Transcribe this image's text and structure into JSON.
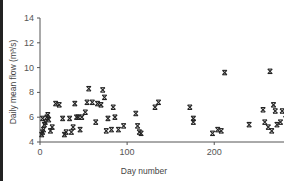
{
  "chart_data": {
    "type": "scatter",
    "title": "",
    "xlabel": "Day number",
    "ylabel": "Daily mean flow (m³/s)",
    "xlim": [
      0,
      365
    ],
    "ylim": [
      4,
      14
    ],
    "xticks": [
      0,
      100,
      200,
      300
    ],
    "yticks": [
      4,
      6,
      8,
      10,
      12,
      14
    ],
    "grid": false,
    "legend": null,
    "marker": "x",
    "series": [
      {
        "name": "Daily mean flow",
        "points": [
          [
            2,
            4.6
          ],
          [
            3,
            4.8
          ],
          [
            4,
            5.0
          ],
          [
            5,
            5.4
          ],
          [
            3,
            5.9
          ],
          [
            6,
            5.6
          ],
          [
            8,
            6.0
          ],
          [
            9,
            6.2
          ],
          [
            10,
            5.8
          ],
          [
            12,
            4.9
          ],
          [
            14,
            5.2
          ],
          [
            18,
            7.1
          ],
          [
            22,
            7.0
          ],
          [
            26,
            5.9
          ],
          [
            28,
            4.6
          ],
          [
            30,
            4.8
          ],
          [
            34,
            5.9
          ],
          [
            36,
            4.8
          ],
          [
            38,
            5.2
          ],
          [
            40,
            7.1
          ],
          [
            42,
            6.0
          ],
          [
            44,
            6.0
          ],
          [
            46,
            5.0
          ],
          [
            48,
            6.0
          ],
          [
            52,
            6.4
          ],
          [
            54,
            7.2
          ],
          [
            56,
            8.3
          ],
          [
            60,
            7.2
          ],
          [
            64,
            5.6
          ],
          [
            66,
            7.1
          ],
          [
            70,
            7.0
          ],
          [
            72,
            8.2
          ],
          [
            74,
            7.6
          ],
          [
            76,
            4.9
          ],
          [
            78,
            5.9
          ],
          [
            82,
            5.0
          ],
          [
            84,
            6.8
          ],
          [
            86,
            6.0
          ],
          [
            90,
            5.0
          ],
          [
            96,
            5.3
          ],
          [
            110,
            6.3
          ],
          [
            112,
            5.3
          ],
          [
            114,
            4.8
          ],
          [
            116,
            4.7
          ],
          [
            132,
            6.8
          ],
          [
            136,
            7.2
          ],
          [
            172,
            6.8
          ],
          [
            176,
            5.9
          ],
          [
            176,
            5.6
          ],
          [
            198,
            4.7
          ],
          [
            204,
            5.0
          ],
          [
            208,
            4.9
          ],
          [
            212,
            9.6
          ],
          [
            240,
            5.4
          ],
          [
            256,
            6.6
          ],
          [
            258,
            5.6
          ],
          [
            262,
            5.2
          ],
          [
            264,
            9.7
          ],
          [
            266,
            4.9
          ],
          [
            268,
            7.0
          ],
          [
            270,
            6.5
          ],
          [
            272,
            5.4
          ],
          [
            276,
            5.6
          ],
          [
            278,
            6.5
          ],
          [
            282,
            6.2
          ],
          [
            284,
            5.0
          ],
          [
            286,
            6.3
          ],
          [
            288,
            5.6
          ],
          [
            290,
            6.4
          ],
          [
            294,
            6.0
          ],
          [
            296,
            5.2
          ],
          [
            298,
            9.4
          ],
          [
            300,
            5.8
          ],
          [
            302,
            5.0
          ],
          [
            304,
            6.3
          ],
          [
            306,
            5.3
          ],
          [
            310,
            5.7
          ],
          [
            312,
            6.0
          ],
          [
            314,
            4.8
          ],
          [
            316,
            5.4
          ],
          [
            318,
            5.0
          ],
          [
            320,
            6.1
          ],
          [
            322,
            6.2
          ],
          [
            324,
            5.0
          ],
          [
            326,
            8.3
          ],
          [
            328,
            5.6
          ],
          [
            330,
            4.9
          ],
          [
            332,
            9.2
          ],
          [
            334,
            5.4
          ],
          [
            336,
            6.3
          ],
          [
            338,
            5.8
          ],
          [
            340,
            4.8
          ],
          [
            342,
            5.5
          ],
          [
            344,
            5.0
          ],
          [
            346,
            6.1
          ],
          [
            348,
            10.0
          ],
          [
            350,
            8.6
          ],
          [
            352,
            5.3
          ],
          [
            354,
            5.6
          ],
          [
            356,
            13.5
          ],
          [
            358,
            9.9
          ],
          [
            360,
            5.2
          ],
          [
            362,
            5.0
          ],
          [
            362,
            9.4
          ]
        ]
      }
    ]
  }
}
